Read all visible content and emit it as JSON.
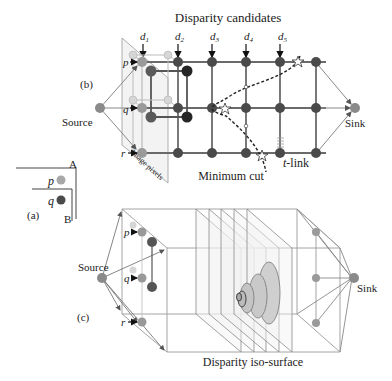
{
  "panel_b": {
    "label": "(b)",
    "title": "Disparity candidates",
    "disparity_labels": [
      "d",
      "d",
      "d",
      "d",
      "d"
    ],
    "disparity_subscripts": [
      "1",
      "2",
      "3",
      "4",
      "5"
    ],
    "pixel_labels": [
      "p",
      "q",
      "r"
    ],
    "source_label": "Source",
    "sink_label": "Sink",
    "image_pixels_label": "Image pixels",
    "t_link_label_italic": "t",
    "t_link_label_rest": "-link",
    "min_cut_label": "Minimum cut"
  },
  "panel_a": {
    "label": "(a)",
    "corner_a": "A",
    "corner_b": "B",
    "pixel_labels": [
      "p",
      "q"
    ]
  },
  "panel_c": {
    "label": "(c)",
    "source_label": "Source",
    "sink_label": "Sink",
    "pixel_labels": [
      "p",
      "q",
      "r"
    ],
    "iso_surface_label": "Disparity iso-surface"
  },
  "colors": {
    "node_dark": "#4a4a4a",
    "node_darker": "#262626",
    "node_mid": "#8a8a8a",
    "node_light": "#cfcfcf",
    "edge": "#7a7a7a",
    "edge_light": "#b5b5b5",
    "plane_fill": "#ececec",
    "ellipse_fill": "#c9c9c9"
  }
}
